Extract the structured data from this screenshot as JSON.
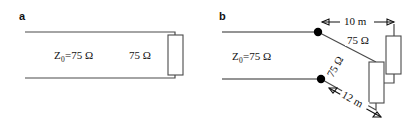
{
  "figure": {
    "background_color": "#ffffff",
    "line_color": "#4a4a4a",
    "dim_color": "#111111",
    "panels": [
      {
        "id": "a",
        "letter": "a",
        "labels": {
          "impedance": "Z",
          "impedance_sub": "0",
          "impedance_value": "=75 Ω",
          "load": "75 Ω"
        }
      },
      {
        "id": "b",
        "letter": "b",
        "labels": {
          "impedance": "Z",
          "impedance_sub": "0",
          "impedance_value": "=75 Ω",
          "stub_upper": "75 Ω",
          "stub_lower": "75 Ω",
          "dim_upper": "10 m",
          "dim_lower": "12 m"
        }
      }
    ]
  }
}
